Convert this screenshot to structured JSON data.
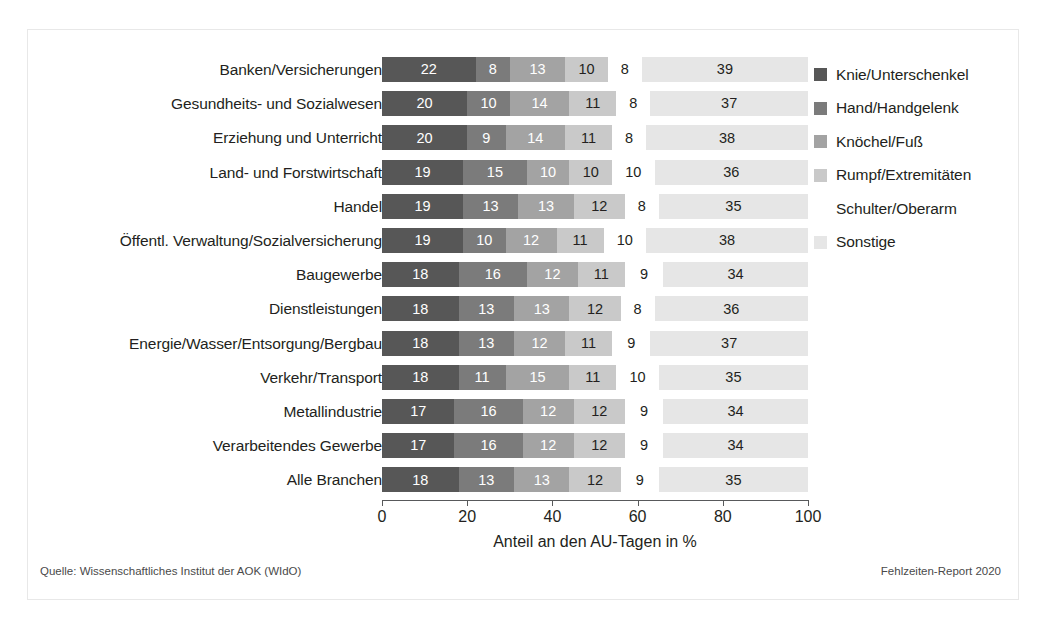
{
  "footer": {
    "source": "Quelle: Wissenschaftliches Institut der AOK (WIdO)",
    "report": "Fehlzeiten-Report 2020"
  },
  "axis": {
    "xlabel": "Anteil an den AU-Tagen in %",
    "ticks": [
      "0",
      "20",
      "40",
      "60",
      "80",
      "100"
    ]
  },
  "legend": {
    "items": [
      {
        "label": "Knie/Unterschenkel",
        "color": "#575757"
      },
      {
        "label": "Hand/Handgelenk",
        "color": "#7b7b7b"
      },
      {
        "label": "Knöchel/Fuß",
        "color": "#a3a3a3"
      },
      {
        "label": "Rumpf/Extremitäten",
        "color": "#c9c9c9"
      },
      {
        "label": "Schulter/Oberarm",
        "color": "#ffffff"
      },
      {
        "label": "Sonstige",
        "color": "#e6e6e6"
      }
    ]
  },
  "chart_data": {
    "type": "bar",
    "orientation": "horizontal",
    "stacked": true,
    "title": "",
    "xlabel": "Anteil an den AU-Tagen in %",
    "ylabel": "",
    "xlim": [
      0,
      100
    ],
    "xticks": [
      0,
      20,
      40,
      60,
      80,
      100
    ],
    "grid": false,
    "legend_position": "right",
    "categories": [
      "Banken/Versicherungen",
      "Gesundheits- und Sozialwesen",
      "Erziehung und Unterricht",
      "Land- und Forstwirtschaft",
      "Handel",
      "Öffentl. Verwaltung/Sozialversicherung",
      "Baugewerbe",
      "Dienstleistungen",
      "Energie/Wasser/Entsorgung/Bergbau",
      "Verkehr/Transport",
      "Metallindustrie",
      "Verarbeitendes Gewerbe",
      "Alle Branchen"
    ],
    "series": [
      {
        "name": "Knie/Unterschenkel",
        "color": "#575757",
        "values": [
          22,
          20,
          20,
          19,
          19,
          19,
          18,
          18,
          18,
          18,
          17,
          17,
          18
        ]
      },
      {
        "name": "Hand/Handgelenk",
        "color": "#7b7b7b",
        "values": [
          8,
          10,
          9,
          15,
          13,
          10,
          16,
          13,
          13,
          11,
          16,
          16,
          13
        ]
      },
      {
        "name": "Knöchel/Fuß",
        "color": "#a3a3a3",
        "values": [
          13,
          14,
          14,
          10,
          13,
          12,
          12,
          13,
          12,
          15,
          12,
          12,
          13
        ]
      },
      {
        "name": "Rumpf/Extremitäten",
        "color": "#c9c9c9",
        "values": [
          10,
          11,
          11,
          10,
          12,
          11,
          11,
          12,
          11,
          11,
          12,
          12,
          12
        ]
      },
      {
        "name": "Schulter/Oberarm",
        "color": "#ffffff",
        "values": [
          8,
          8,
          8,
          10,
          8,
          10,
          9,
          8,
          9,
          10,
          9,
          9,
          9
        ]
      },
      {
        "name": "Sonstige",
        "color": "#e6e6e6",
        "values": [
          39,
          37,
          38,
          36,
          35,
          38,
          34,
          36,
          37,
          35,
          34,
          34,
          35
        ]
      }
    ]
  }
}
